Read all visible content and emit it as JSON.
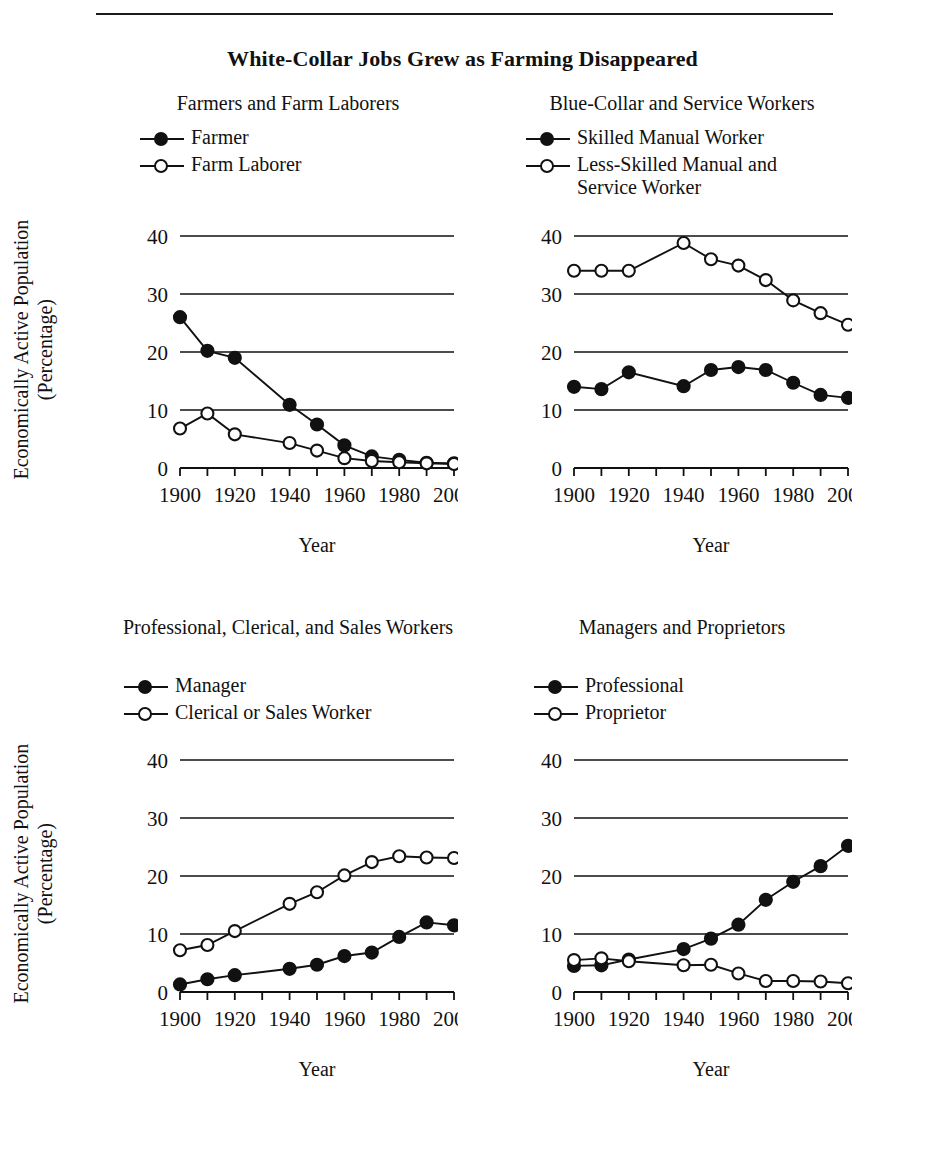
{
  "running_head": "",
  "figure": {
    "title": "White-Collar Jobs Grew as Farming Disappeared",
    "ylabel_line1": "Economically Active Population",
    "ylabel_line2": "(Percentage)",
    "xlabel": "Year"
  },
  "axis": {
    "y_ticks": [
      "0",
      "10",
      "20",
      "30",
      "40"
    ],
    "x_ticks": [
      "1900",
      "1920",
      "1940",
      "1960",
      "1980",
      "2000"
    ]
  },
  "chart_data": [
    {
      "type": "line",
      "title": "Farmers and Farm Laborers",
      "xlabel": "Year",
      "ylabel": "Economically Active Population (Percentage)",
      "xlim": [
        1900,
        2000
      ],
      "ylim": [
        0,
        40
      ],
      "grid": true,
      "legend_position": "above-plot-left",
      "x": [
        1900,
        1910,
        1920,
        1940,
        1950,
        1960,
        1970,
        1980,
        1990,
        2000
      ],
      "series": [
        {
          "name": "Farmer",
          "marker": "filled-circle",
          "values": [
            26.0,
            20.2,
            19.0,
            10.9,
            7.5,
            3.9,
            2.0,
            1.4,
            0.9,
            0.8
          ]
        },
        {
          "name": "Farm Laborer",
          "marker": "open-circle",
          "values": [
            6.8,
            9.4,
            5.8,
            4.3,
            3.0,
            1.7,
            1.2,
            1.0,
            0.8,
            0.7
          ]
        }
      ]
    },
    {
      "type": "line",
      "title": "Blue-Collar and Service Workers",
      "xlabel": "Year",
      "ylabel": "Economically Active Population (Percentage)",
      "xlim": [
        1900,
        2000
      ],
      "ylim": [
        0,
        40
      ],
      "grid": true,
      "legend_position": "above-plot-left",
      "x": [
        1900,
        1910,
        1920,
        1940,
        1950,
        1960,
        1970,
        1980,
        1990,
        2000
      ],
      "series": [
        {
          "name": "Skilled Manual Worker",
          "marker": "filled-circle",
          "values": [
            14.0,
            13.6,
            16.5,
            14.1,
            16.9,
            17.4,
            16.9,
            14.7,
            12.6,
            12.1
          ]
        },
        {
          "name": "Less-Skilled Manual and\nService Worker",
          "marker": "open-circle",
          "values": [
            34.0,
            34.0,
            34.0,
            38.8,
            36.0,
            34.9,
            32.4,
            28.9,
            26.7,
            24.7
          ]
        }
      ]
    },
    {
      "type": "line",
      "title": "Professional, Clerical, and\nSales Workers",
      "xlabel": "Year",
      "ylabel": "Economically Active Population (Percentage)",
      "xlim": [
        1900,
        2000
      ],
      "ylim": [
        0,
        40
      ],
      "grid": true,
      "legend_position": "above-plot-left",
      "x": [
        1900,
        1910,
        1920,
        1940,
        1950,
        1960,
        1970,
        1980,
        1990,
        2000
      ],
      "series": [
        {
          "name": "Manager",
          "marker": "filled-circle",
          "values": [
            1.3,
            2.2,
            2.9,
            4.0,
            4.7,
            6.2,
            6.8,
            9.5,
            12.0,
            11.5
          ]
        },
        {
          "name": "Clerical or Sales Worker",
          "marker": "open-circle",
          "values": [
            7.2,
            8.1,
            10.5,
            15.2,
            17.2,
            20.1,
            22.4,
            23.4,
            23.2,
            23.1
          ]
        }
      ]
    },
    {
      "type": "line",
      "title": "Managers and Proprietors",
      "xlabel": "Year",
      "ylabel": "Economically Active Population (Percentage)",
      "xlim": [
        1900,
        2000
      ],
      "ylim": [
        0,
        40
      ],
      "grid": true,
      "legend_position": "above-plot-left",
      "x": [
        1900,
        1910,
        1920,
        1940,
        1950,
        1960,
        1970,
        1980,
        1990,
        2000
      ],
      "series": [
        {
          "name": "Professional",
          "marker": "filled-circle",
          "values": [
            4.5,
            4.6,
            5.6,
            7.4,
            9.2,
            11.6,
            15.9,
            19.0,
            21.7,
            25.2
          ]
        },
        {
          "name": "Proprietor",
          "marker": "open-circle",
          "values": [
            5.5,
            5.8,
            5.3,
            4.6,
            4.7,
            3.2,
            1.9,
            1.9,
            1.8,
            1.5
          ]
        }
      ]
    }
  ],
  "colors": {
    "ink": "#111111",
    "paper": "#ffffff"
  }
}
